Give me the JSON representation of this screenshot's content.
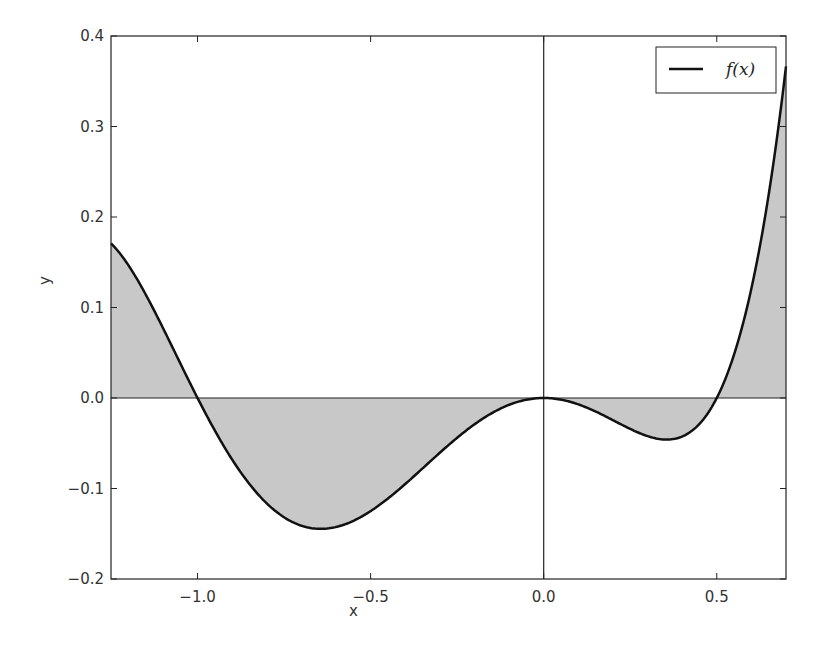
{
  "chart_data": {
    "type": "line",
    "title": "",
    "xlabel": "x",
    "ylabel": "y",
    "xlim": [
      -1.25,
      0.7
    ],
    "ylim": [
      -0.2,
      0.4
    ],
    "x_ticks": [
      -1.0,
      -0.5,
      0.0,
      0.5
    ],
    "x_tick_labels": [
      "−1.0",
      "−0.5",
      "0.0",
      "0.5"
    ],
    "y_ticks": [
      -0.2,
      -0.1,
      0.0,
      0.1,
      0.2,
      0.3,
      0.4
    ],
    "y_tick_labels": [
      "−0.2",
      "−0.1",
      "0.0",
      "0.1",
      "0.2",
      "0.3",
      "0.4"
    ],
    "grid": false,
    "legend": {
      "position": "top-right",
      "entries": [
        "f(x)"
      ]
    },
    "reference_lines": {
      "horizontal_y": 0,
      "vertical_x": 0
    },
    "fill_between_curve_and_zero": true,
    "series": [
      {
        "name": "f(x)",
        "color": "#111111",
        "fill_color": "#c8c8c8",
        "x": [
          -1.25,
          -1.2,
          -1.15,
          -1.1,
          -1.05,
          -1.0,
          -0.95,
          -0.9,
          -0.85,
          -0.8,
          -0.75,
          -0.7,
          -0.65,
          -0.6,
          -0.55,
          -0.5,
          -0.45,
          -0.4,
          -0.35,
          -0.3,
          -0.25,
          -0.2,
          -0.15,
          -0.1,
          -0.05,
          0.0,
          0.05,
          0.1,
          0.15,
          0.2,
          0.25,
          0.3,
          0.35,
          0.4,
          0.45,
          0.5,
          0.55,
          0.6,
          0.65,
          0.7
        ],
        "y": [
          0.1709,
          0.1296,
          0.091,
          0.0561,
          0.0257,
          0.0,
          -0.0207,
          -0.0365,
          -0.0479,
          -0.0555,
          -0.0598,
          -0.0614,
          -0.0607,
          -0.0583,
          -0.0546,
          -0.05,
          -0.0448,
          -0.0393,
          -0.0338,
          -0.0284,
          -0.0232,
          -0.0184,
          -0.0141,
          -0.0102,
          -0.0068,
          0.0,
          0.0,
          0.0,
          0.0,
          0.0,
          0.0,
          0.0,
          0.0,
          0.0,
          0.0,
          0.0,
          0.0,
          0.0,
          0.0,
          0.3666
        ]
      }
    ]
  }
}
